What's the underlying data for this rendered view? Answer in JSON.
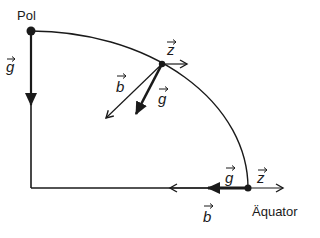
{
  "diagram": {
    "labels": {
      "pole": "Pol",
      "equator": "Äquator"
    },
    "vectors": {
      "g": "g",
      "b": "b",
      "z": "z"
    },
    "points": [
      {
        "name": "pole",
        "vectors": [
          "g"
        ]
      },
      {
        "name": "mid-latitude",
        "vectors": [
          "z",
          "b",
          "g"
        ]
      },
      {
        "name": "equator",
        "vectors": [
          "z",
          "g",
          "b"
        ]
      }
    ],
    "colors": {
      "ink": "#1a1a1a",
      "background": "#ffffff"
    }
  }
}
